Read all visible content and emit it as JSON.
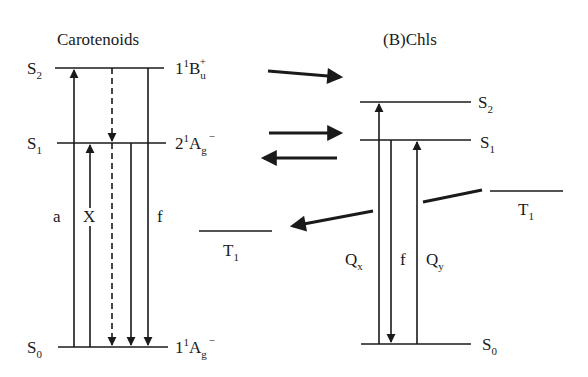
{
  "diagram": {
    "left_panel": {
      "title": "Carotenoids",
      "levels": [
        {
          "name": "S2",
          "base": "S",
          "sub": "2",
          "term": {
            "pre": "1",
            "presup": "1",
            "sym": "B",
            "sub": "u",
            "sup": "+"
          }
        },
        {
          "name": "S1",
          "base": "S",
          "sub": "1",
          "term": {
            "pre": "2",
            "presup": "1",
            "sym": "A",
            "sub": "g",
            "sup": "−"
          }
        },
        {
          "name": "S0",
          "base": "S",
          "sub": "0",
          "term": {
            "pre": "1",
            "presup": "1",
            "sym": "A",
            "sub": "g",
            "sup": "−"
          }
        }
      ],
      "transition_labels": {
        "absorption": "a",
        "x": "X",
        "fluorescence": "f"
      },
      "triplet": {
        "base": "T",
        "sub": "1"
      }
    },
    "right_panel": {
      "title": "(B)Chls",
      "levels": [
        {
          "name": "S2",
          "base": "S",
          "sub": "2"
        },
        {
          "name": "S1",
          "base": "S",
          "sub": "1"
        },
        {
          "name": "S0",
          "base": "S",
          "sub": "0"
        }
      ],
      "transition_labels": {
        "qx": {
          "base": "Q",
          "sub": "x"
        },
        "fluorescence": "f",
        "qy": {
          "base": "Q",
          "sub": "y"
        }
      },
      "triplet": {
        "base": "T",
        "sub": "1"
      }
    },
    "energy_transfer_arrows": [
      {
        "from": "Car S2",
        "to": "Chl S2",
        "direction": "right"
      },
      {
        "from": "Car S1",
        "to": "Chl S1",
        "direction": "right"
      },
      {
        "from": "Chl S1",
        "to": "Car S1",
        "direction": "left"
      },
      {
        "from": "Chl T1",
        "to": "Car T1",
        "direction": "left"
      }
    ]
  }
}
